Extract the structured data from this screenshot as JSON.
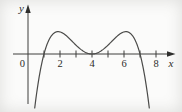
{
  "figure": {
    "background": "#fbfbfa",
    "axis_color": "#3e3e3c",
    "curve_color": "#4b4b49",
    "labels": {
      "x_axis": "x",
      "y_axis": "y",
      "origin": "0"
    }
  },
  "chart_data": {
    "type": "line",
    "title": "",
    "xlabel": "x",
    "ylabel": "y",
    "origin_label": "0",
    "grid": false,
    "legend": false,
    "x_ticks": [
      1,
      2,
      3,
      4,
      5,
      6,
      7,
      8
    ],
    "x_tick_labels": [
      {
        "x": 2,
        "label": "2"
      },
      {
        "x": 4,
        "label": "4"
      },
      {
        "x": 6,
        "label": "6"
      },
      {
        "x": 8,
        "label": "8"
      }
    ],
    "x_axis_range_shown": [
      -0.9,
      9.1
    ],
    "curve": {
      "kind": "polynomial",
      "equation": "y = k*(9*(x-4)^2 - (x-4)^4)",
      "k": 0.069,
      "center": 4,
      "zeros": [
        1,
        7
      ],
      "double_root_touch_point": {
        "x": 4,
        "y": 0
      },
      "local_maxima": [
        {
          "x": 1.9,
          "y": 1.4
        },
        {
          "x": 6.1,
          "y": 1.4
        }
      ],
      "local_minimum": {
        "x": 4,
        "y": 0
      },
      "plot_x_range": [
        0.42,
        7.58
      ],
      "sample_step": 0.04
    }
  }
}
